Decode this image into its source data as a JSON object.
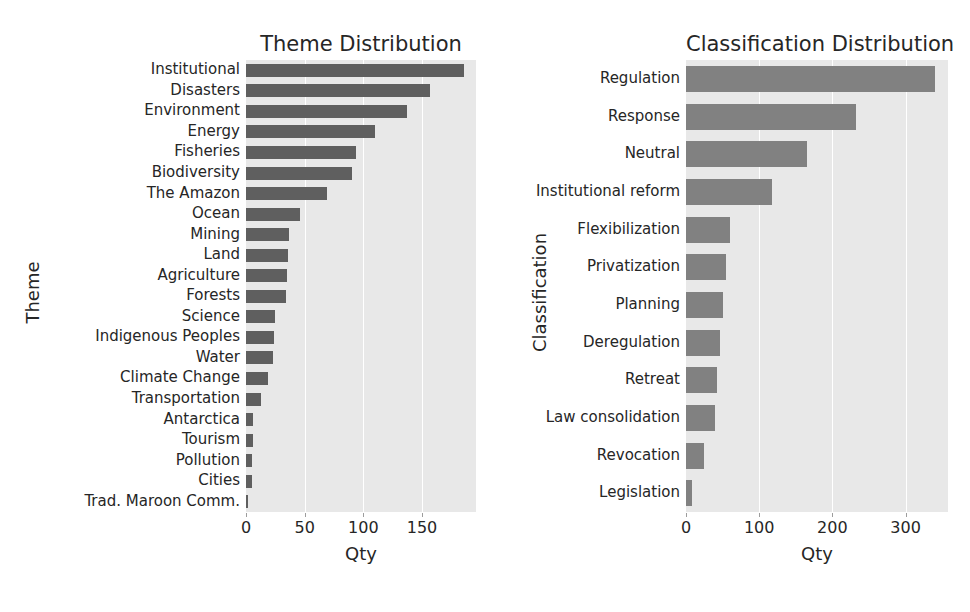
{
  "figure": {
    "background": "#ffffff",
    "plot_background": "#e8e8e8",
    "bar_color_left": "#5f5f5f",
    "bar_color_right": "#818181"
  },
  "chart_data": [
    {
      "type": "bar",
      "orientation": "horizontal",
      "title": "Theme Distribution",
      "xlabel": "Qty",
      "ylabel": "Theme",
      "xlim": [
        0,
        196
      ],
      "xticks": [
        0,
        50,
        100,
        150
      ],
      "xticklabels": [
        "0",
        "50",
        "100",
        "150"
      ],
      "grid": true,
      "legend": "none",
      "categories": [
        "Institutional",
        "Disasters",
        "Environment",
        "Energy",
        "Fisheries",
        "Biodiversity",
        "The Amazon",
        "Ocean",
        "Mining",
        "Land",
        "Agriculture",
        "Forests",
        "Science",
        "Indigenous Peoples",
        "Water",
        "Climate Change",
        "Transportation",
        "Antarctica",
        "Tourism",
        "Pollution",
        "Cities",
        "Trad. Maroon Comm."
      ],
      "values": [
        186,
        157,
        137,
        110,
        94,
        90,
        69,
        46,
        37,
        36,
        35,
        34,
        25,
        24,
        23,
        19,
        13,
        6,
        6,
        5,
        5,
        1
      ]
    },
    {
      "type": "bar",
      "orientation": "horizontal",
      "title": "Classification Distribution",
      "xlabel": "Qty",
      "ylabel": "Classification",
      "xlim": [
        0,
        358
      ],
      "xticks": [
        0,
        100,
        200,
        300
      ],
      "xticklabels": [
        "0",
        "100",
        "200",
        "300"
      ],
      "grid": true,
      "legend": "none",
      "categories": [
        "Regulation",
        "Response",
        "Neutral",
        "Institutional reform",
        "Flexibilization",
        "Privatization",
        "Planning",
        "Deregulation",
        "Retreat",
        "Law consolidation",
        "Revocation",
        "Legislation"
      ],
      "values": [
        340,
        232,
        165,
        118,
        60,
        55,
        50,
        47,
        42,
        39,
        25,
        8
      ]
    }
  ]
}
